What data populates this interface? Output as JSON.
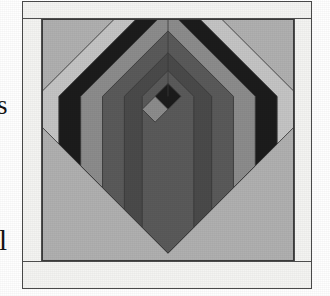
{
  "page": {
    "background_color": "#ffffff",
    "width": 330,
    "height": 296,
    "margin_text_fragments": [
      {
        "name": "clipped-letter-s",
        "text": "s"
      },
      {
        "name": "clipped-letter-l",
        "text": "l"
      }
    ]
  },
  "figure": {
    "kind": "quilt-block-diagram",
    "frame_border_color": "#4a4a4a",
    "sashing_color": "#f4f4f2",
    "sashing": {
      "top_label": "top sashing strip",
      "bottom_label": "bottom sashing strip",
      "left_label": "left sashing strip",
      "right_label": "right sashing strip"
    },
    "palette": {
      "background_light": "#b0b0b0",
      "light_gray": "#c4c4c4",
      "medium_gray": "#8c8c8c",
      "medium_dark_gray": "#5a5a5a",
      "dark_gray": "#4a4a4a",
      "near_black": "#1c1c1c",
      "seam_line": "#3a3a3a"
    },
    "block": {
      "name": "chevron log cabin block",
      "orientation": "on-point / 45 degrees",
      "center": {
        "dark_patch_color": "#1c1c1c",
        "light_patch_color": "#8c8c8c"
      },
      "rings": [
        {
          "index": 1,
          "color": "#c4c4c4",
          "tone": "light"
        },
        {
          "index": 2,
          "color": "#1c1c1c",
          "tone": "near-black"
        },
        {
          "index": 3,
          "color": "#8c8c8c",
          "tone": "medium"
        },
        {
          "index": 4,
          "color": "#5a5a5a",
          "tone": "medium-dark"
        },
        {
          "index": 5,
          "color": "#4a4a4a",
          "tone": "dark"
        },
        {
          "index": 6,
          "color": "#5a5a5a",
          "tone": "medium-dark"
        }
      ],
      "corner_fill_color": "#b0b0b0"
    }
  }
}
